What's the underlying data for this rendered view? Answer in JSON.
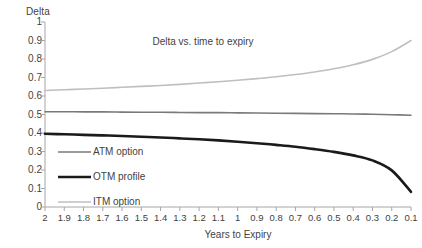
{
  "chart_data": {
    "type": "line",
    "title": "Delta vs. time to expiry",
    "xlabel": "Years to Expiry",
    "ylabel": "Delta",
    "xlim": [
      2.0,
      0.1
    ],
    "ylim": [
      0,
      1
    ],
    "x_reversed": true,
    "grid": false,
    "legend_position": "inside-lower-left",
    "xticks": [
      "2",
      "1.9",
      "1.8",
      "1.7",
      "1.6",
      "1.5",
      "1.4",
      "1.3",
      "1.2",
      "1.1",
      "1",
      "0.9",
      "0.8",
      "0.7",
      "0.6",
      "0.5",
      "0.4",
      "0.3",
      "0.2",
      "0.1"
    ],
    "yticks": [
      "0",
      "0.1",
      "0.2",
      "0.3",
      "0.4",
      "0.5",
      "0.6",
      "0.7",
      "0.8",
      "0.9",
      "1"
    ],
    "x": [
      2.0,
      1.9,
      1.8,
      1.7,
      1.6,
      1.5,
      1.4,
      1.3,
      1.2,
      1.1,
      1.0,
      0.9,
      0.8,
      0.7,
      0.6,
      0.5,
      0.4,
      0.3,
      0.2,
      0.1
    ],
    "series": [
      {
        "name": "ATM option",
        "color": "#7a7a7a",
        "width": 1.6,
        "values": [
          0.515,
          0.515,
          0.514,
          0.514,
          0.513,
          0.512,
          0.512,
          0.511,
          0.51,
          0.51,
          0.509,
          0.508,
          0.507,
          0.506,
          0.505,
          0.504,
          0.503,
          0.501,
          0.499,
          0.496
        ]
      },
      {
        "name": "OTM profile",
        "color": "#1a1a1a",
        "width": 2.6,
        "values": [
          0.396,
          0.393,
          0.39,
          0.387,
          0.384,
          0.38,
          0.376,
          0.371,
          0.366,
          0.36,
          0.353,
          0.345,
          0.336,
          0.326,
          0.313,
          0.298,
          0.279,
          0.252,
          0.198,
          0.082
        ]
      },
      {
        "name": "ITM option",
        "color": "#bfbfbf",
        "width": 1.6,
        "values": [
          0.63,
          0.634,
          0.638,
          0.642,
          0.647,
          0.652,
          0.657,
          0.663,
          0.67,
          0.677,
          0.685,
          0.694,
          0.704,
          0.716,
          0.73,
          0.747,
          0.769,
          0.798,
          0.84,
          0.9
        ]
      }
    ]
  },
  "legend": {
    "items": [
      {
        "label": "ATM option"
      },
      {
        "label": "OTM profile"
      },
      {
        "label": "ITM option"
      }
    ]
  },
  "axis_colors": {
    "axis_line": "#a6a6a6",
    "text": "#3f3f3f"
  }
}
